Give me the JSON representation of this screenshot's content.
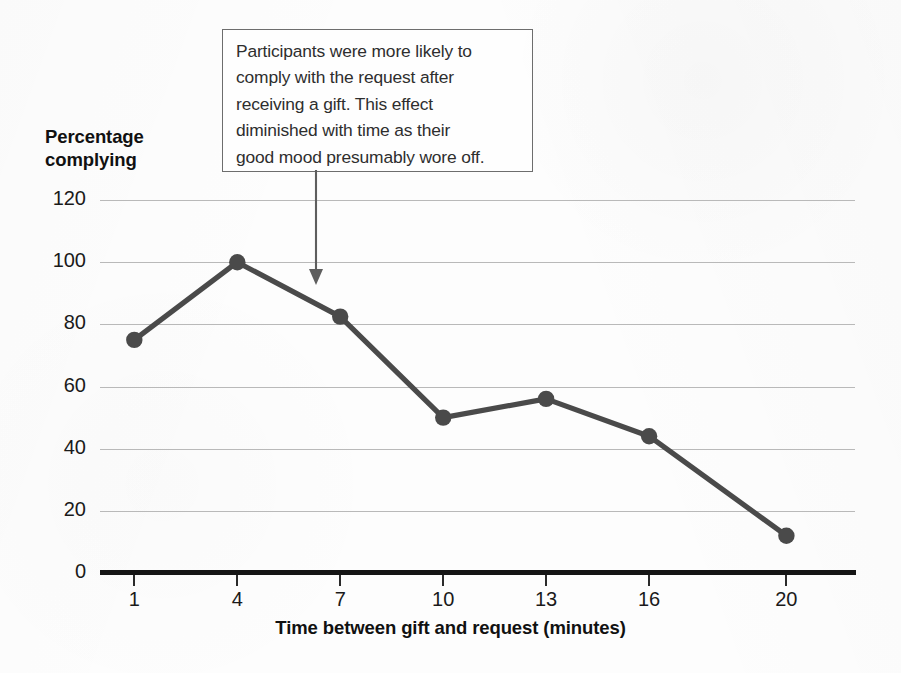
{
  "chart_data": {
    "type": "line",
    "title": "",
    "xlabel": "Time between gift and request (minutes)",
    "ylabel": "Percentage complying",
    "x": [
      1,
      4,
      7,
      10,
      13,
      16,
      20
    ],
    "values": [
      75,
      100,
      82.5,
      50,
      56,
      44,
      12
    ],
    "categories": [
      "1",
      "4",
      "7",
      "10",
      "13",
      "16",
      "20"
    ],
    "x_tick_labels": [
      "1",
      "4",
      "7",
      "10",
      "13",
      "16",
      "20"
    ],
    "y_tick_labels": [
      "0",
      "20",
      "40",
      "60",
      "80",
      "100",
      "120"
    ],
    "y_ticks": [
      0,
      20,
      40,
      60,
      80,
      100,
      120
    ],
    "ylim": [
      0,
      120
    ],
    "xlim": [
      0,
      22
    ],
    "grid": "horizontal",
    "legend": "none",
    "series": [
      {
        "name": "Percentage complying",
        "values": [
          75,
          100,
          82.5,
          50,
          56,
          44,
          12
        ]
      }
    ],
    "annotations": [
      {
        "text": "Participants were more likely to comply with the request after receiving a gift. This effect diminished with time as their good mood presumably wore off.",
        "points_to_x": 5.5,
        "points_to_y": 92,
        "style": "boxed-with-arrow"
      }
    ],
    "colors": {
      "line": "#4a4a4a",
      "marker": "#4a4a4a",
      "grid": "#b9b9b9",
      "axis": "#151515",
      "text": "#1a1a1a",
      "annotation_border": "#6d6d6d",
      "background": "#fdfdfd"
    }
  },
  "axes": {
    "y_title_line1": "Percentage",
    "y_title_line2": "complying",
    "x_title": "Time between gift and request (minutes)"
  },
  "annotation": {
    "line1": "Participants were more likely to",
    "line2": "comply with the request after",
    "line3": "receiving a gift. This effect",
    "line4": "diminished with time as their",
    "line5": "good mood presumably wore off."
  }
}
